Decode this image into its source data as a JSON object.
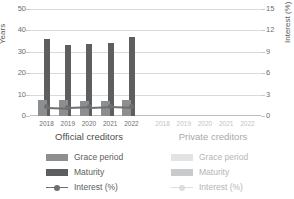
{
  "chart_data": {
    "type": "bar",
    "title": "",
    "subtitle": "",
    "ylabel": "Years",
    "ylabel_secondary": "Interest (%)",
    "xlabel": "",
    "ylim": [
      0,
      50
    ],
    "ylim_secondary": [
      0,
      15
    ],
    "yticks": [
      "0",
      "10",
      "20",
      "30",
      "40",
      "50"
    ],
    "ytick_values": [
      0,
      10,
      20,
      30,
      40,
      50
    ],
    "yticks_secondary": [
      "0",
      "3",
      "6",
      "9",
      "12",
      "15"
    ],
    "ytick_values_secondary": [
      0,
      3,
      6,
      9,
      12,
      15
    ],
    "grid": true,
    "grid_axis": "y",
    "legend_position": "bottom",
    "categories": [
      "2018",
      "2019",
      "2020",
      "2021",
      "2022"
    ],
    "panels": [
      {
        "name": "official",
        "label": "Official creditors",
        "series": [
          {
            "name": "Grace period",
            "axis": "left",
            "unit": "Years",
            "values": [
              7.3,
              7.6,
              7.0,
              7.2,
              7.3
            ]
          },
          {
            "name": "Maturity",
            "axis": "left",
            "unit": "Years",
            "values": [
              36.0,
              33.0,
              33.5,
              34.0,
              37.0
            ]
          },
          {
            "name": "Interest (%)",
            "axis": "right",
            "unit": "%",
            "values": [
              1.3,
              1.2,
              1.3,
              1.4,
              1.3
            ]
          }
        ]
      },
      {
        "name": "private",
        "label": "Private creditors",
        "series": [
          {
            "name": "Grace period",
            "axis": "left",
            "unit": "Years",
            "values": [
              null,
              null,
              null,
              null,
              null
            ]
          },
          {
            "name": "Maturity",
            "axis": "left",
            "unit": "Years",
            "values": [
              null,
              null,
              null,
              null,
              null
            ]
          },
          {
            "name": "Interest (%)",
            "axis": "right",
            "unit": "%",
            "values": [
              null,
              null,
              null,
              null,
              null
            ]
          }
        ]
      }
    ],
    "legends": [
      {
        "panel": "official",
        "entries": [
          {
            "label": "Grace period",
            "marker": "square",
            "color": "#8d8e90"
          },
          {
            "label": "Maturity",
            "marker": "square",
            "color": "#5d5e60"
          },
          {
            "label": "Interest (%)",
            "marker": "line-dot",
            "color": "#6e6f71"
          }
        ]
      },
      {
        "panel": "private",
        "entries": [
          {
            "label": "Grace period",
            "marker": "square",
            "color": "#e2e3e4"
          },
          {
            "label": "Maturity",
            "marker": "square",
            "color": "#c9cacb"
          },
          {
            "label": "Interest (%)",
            "marker": "line-dot",
            "color": "#dcdddd"
          }
        ]
      }
    ],
    "colors": {
      "grace_official": "#8d8e90",
      "maturity_official": "#5d5e60",
      "interest_official": "#6e6f71",
      "grace_private": "#e2e3e4",
      "maturity_private": "#c9cacb",
      "interest_private": "#dcdddd",
      "grid": "#d9dadb",
      "axis_text": "#6d6e71",
      "axis_text_muted": "#c3c4c6",
      "background": "#ffffff"
    }
  }
}
